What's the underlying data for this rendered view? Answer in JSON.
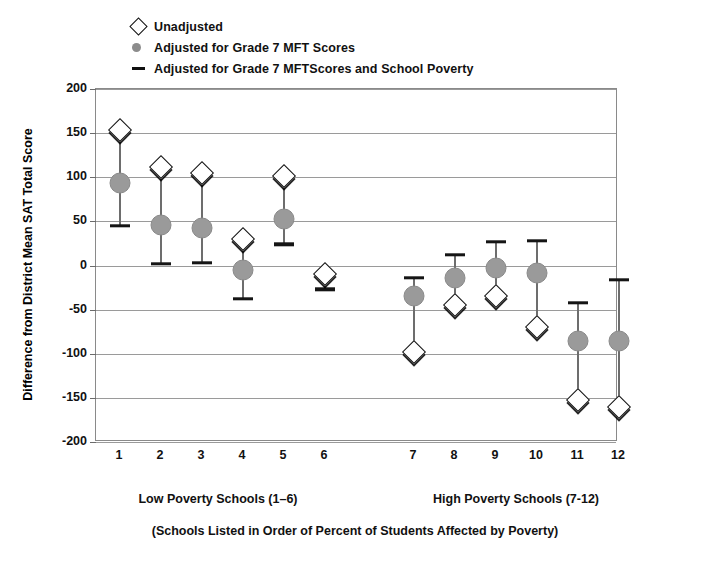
{
  "legend": {
    "items": [
      {
        "icon": "diamond-marker-icon",
        "label": "Unadjusted"
      },
      {
        "icon": "circle-marker-icon",
        "label": "Adjusted for Grade 7 MFT Scores"
      },
      {
        "icon": "dash-marker-icon",
        "label": "Adjusted for Grade 7 MFTScores and School Poverty"
      }
    ]
  },
  "axis": {
    "y_title": "Difference from District Mean SAT Total Score",
    "y_ticks": [
      "200",
      "150",
      "100",
      "50",
      "0",
      "-50",
      "-100",
      "-150",
      "-200"
    ]
  },
  "groups": {
    "low": "Low Poverty Schools (1–6)",
    "high": "High Poverty Schools (7-12)"
  },
  "footnote": "(Schools Listed in Order of Percent of Students Affected by Poverty)",
  "chart_data": {
    "type": "scatter",
    "title": "",
    "xlabel": "(Schools Listed in Order of Percent of Students Affected by Poverty)",
    "ylabel": "Difference from District Mean SAT Total Score",
    "ylim": [
      -200,
      200
    ],
    "ytick_step": 50,
    "grid": true,
    "legend_position": "top-left",
    "categories": [
      "1",
      "2",
      "3",
      "4",
      "5",
      "6",
      "7",
      "8",
      "9",
      "10",
      "11",
      "12"
    ],
    "series": [
      {
        "name": "Unadjusted",
        "marker": "diamond",
        "values": [
          153,
          112,
          105,
          30,
          101,
          -10,
          -98,
          -45,
          -34,
          -70,
          -152,
          -160
        ]
      },
      {
        "name": "Adjusted for Grade 7 MFT Scores",
        "marker": "circle",
        "values": [
          93,
          46,
          43,
          -5,
          53,
          null,
          -34,
          -14,
          -3,
          -9,
          -85,
          -85
        ]
      },
      {
        "name": "Adjusted for Grade 7 MFTScores and School Poverty",
        "marker": "dash",
        "values": [
          45,
          2,
          3,
          -38,
          24,
          -27,
          -14,
          12,
          27,
          28,
          -42,
          -16
        ]
      }
    ],
    "groups": [
      {
        "label": "Low Poverty Schools (1–6)",
        "categories": [
          "1",
          "2",
          "3",
          "4",
          "5",
          "6"
        ]
      },
      {
        "label": "High Poverty Schools (7-12)",
        "categories": [
          "7",
          "8",
          "9",
          "10",
          "11",
          "12"
        ]
      }
    ],
    "colors": {
      "diamond_fill": "#ffffff",
      "diamond_stroke": "#151515",
      "circle_fill": "#9a9a9a",
      "dash": "#151515",
      "grid": "#9a9a9a",
      "frame": "#8a8a8a"
    }
  }
}
